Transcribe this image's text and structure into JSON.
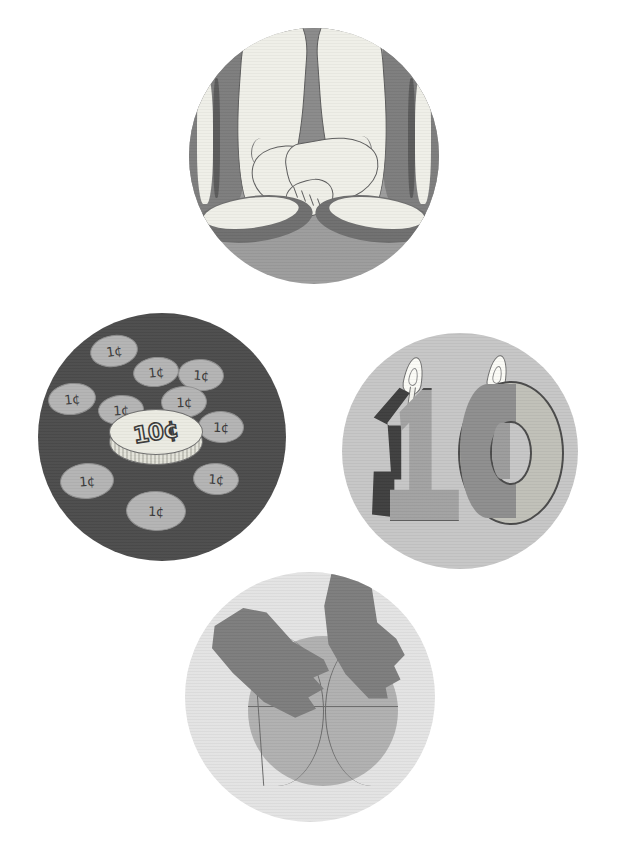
{
  "page": {
    "background_color": "#ffffff",
    "width": 617,
    "height": 867
  },
  "panels": [
    {
      "id": "feet",
      "name": "crossed-bare-feet",
      "caption": "Two bare feet crossed at the ankles above a pair of shoes",
      "background_color": "#9c9c9c",
      "skin_color": "#efefe8",
      "outline_color": "#5d5d5d",
      "shadow_color": "#8a8a8a",
      "counts": {
        "feet": 2,
        "toes_visible": 5,
        "shoes": 2
      },
      "center": {
        "x": 314,
        "y": 156
      },
      "radius": 125
    },
    {
      "id": "coins",
      "name": "ten-pennies-and-a-dime",
      "caption": "Ten one-cent coins surrounding a single ten-cent coin",
      "background_color": "#4c4c4c",
      "penny_color": "#b4b4b4",
      "dime_color": "#ebebe2",
      "outline_color": "#6d6d6d",
      "dime_label": "10¢",
      "penny_label": "1¢",
      "penny_count": 10,
      "center": {
        "x": 162,
        "y": 437
      },
      "radius": 124,
      "pennies": [
        {
          "label": "1¢",
          "x": 52,
          "y": 22,
          "w": 46,
          "h": 30,
          "rot": -8
        },
        {
          "label": "1¢",
          "x": 95,
          "y": 44,
          "w": 44,
          "h": 28,
          "rot": -6
        },
        {
          "label": "1¢",
          "x": 140,
          "y": 46,
          "w": 44,
          "h": 30,
          "rot": 4
        },
        {
          "label": "1¢",
          "x": 10,
          "y": 70,
          "w": 46,
          "h": 30,
          "rot": -6
        },
        {
          "label": "1¢",
          "x": 123,
          "y": 73,
          "w": 44,
          "h": 30,
          "rot": -2
        },
        {
          "label": "1¢",
          "x": 60,
          "y": 82,
          "w": 44,
          "h": 28,
          "rot": -4
        },
        {
          "label": "1¢",
          "x": 160,
          "y": 98,
          "w": 44,
          "h": 30,
          "rot": 2
        },
        {
          "label": "1¢",
          "x": 22,
          "y": 150,
          "w": 52,
          "h": 34,
          "rot": -4
        },
        {
          "label": "1¢",
          "x": 155,
          "y": 150,
          "w": 44,
          "h": 30,
          "rot": 4
        },
        {
          "label": "1¢",
          "x": 88,
          "y": 178,
          "w": 58,
          "h": 38,
          "rot": 2
        }
      ]
    },
    {
      "id": "candles",
      "name": "number-ten-birthday-candles",
      "caption": "Lit birthday candles shaped like the numerals one and zero",
      "background_color": "#c6c6c6",
      "candle_color": "#a2a2a2",
      "zero_color": "#c0c0b8",
      "shadow_color": "#3f3f3f",
      "flame_color": "#fbfbf6",
      "outline_color": "#4a4a4a",
      "number": "10",
      "digits": [
        "1",
        "0"
      ],
      "flame_count": 2,
      "center": {
        "x": 460,
        "y": 451
      },
      "radius": 118
    },
    {
      "id": "basketball",
      "name": "hands-holding-basketball",
      "caption": "Two hands reaching down onto a basketball",
      "background_color": "#e3e3e3",
      "ball_color": "#b0b0b0",
      "seam_color": "#6a6a6a",
      "hand_color": "#7d7d7d",
      "counts": {
        "hands": 2,
        "balls": 1,
        "seams": 4
      },
      "center": {
        "x": 310,
        "y": 697
      },
      "radius": 125
    }
  ]
}
